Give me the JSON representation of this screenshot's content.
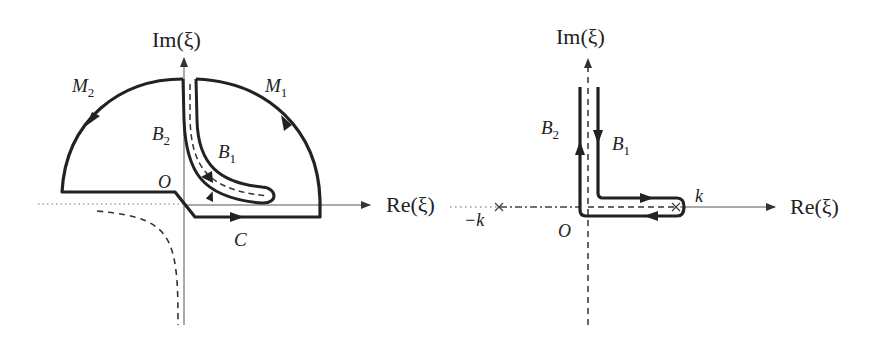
{
  "figure": {
    "left_panel": {
      "axis_labels": {
        "imag": "Im(ξ)",
        "real": "Re(ξ)"
      },
      "origin_label": "O",
      "contours": {
        "M1": {
          "name": "M",
          "sub": "1"
        },
        "M2": {
          "name": "M",
          "sub": "2"
        },
        "B1": {
          "name": "B",
          "sub": "1"
        },
        "B2": {
          "name": "B",
          "sub": "2"
        },
        "C": {
          "name": "C"
        }
      }
    },
    "right_panel": {
      "axis_labels": {
        "imag": "Im(ξ)",
        "real": "Re(ξ)"
      },
      "origin_label": "O",
      "points": {
        "k": "k",
        "minus_k": "−k"
      },
      "contours": {
        "B1": {
          "name": "B",
          "sub": "1"
        },
        "B2": {
          "name": "B",
          "sub": "2"
        }
      }
    },
    "colors": {
      "stroke": "#222222",
      "axis": "#555555",
      "background": "#ffffff"
    }
  }
}
